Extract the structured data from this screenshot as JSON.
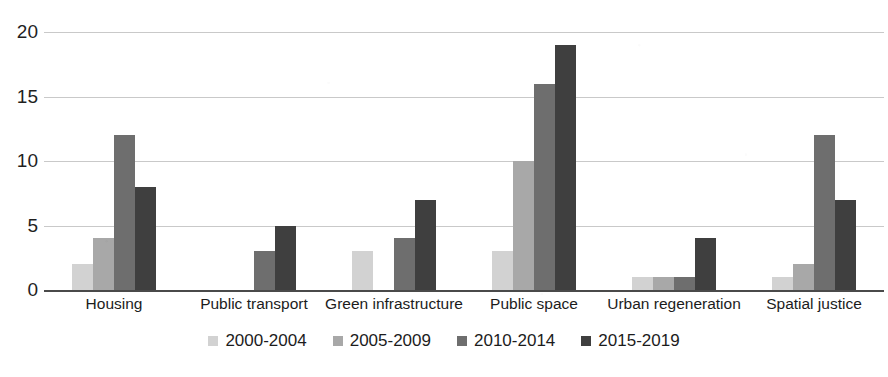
{
  "chart_data": {
    "type": "bar",
    "title": "",
    "subtitle": "",
    "xlabel": "",
    "ylabel": "",
    "ylim": [
      0,
      20
    ],
    "yticks": [
      0,
      5,
      10,
      15,
      20
    ],
    "ytick_labels": [
      "0",
      "5",
      "10",
      "15",
      "20"
    ],
    "grid": true,
    "legend_position": "bottom",
    "orientation": "vertical",
    "grouping": "grouped",
    "categories": [
      "Housing",
      "Public transport",
      "Green infrastructure",
      "Public space",
      "Urban regeneration",
      "Spatial justice"
    ],
    "series": [
      {
        "name": "2000-2004",
        "color": "#d2d2d2",
        "values": [
          2,
          0,
          3,
          3,
          1,
          1
        ]
      },
      {
        "name": "2005-2009",
        "color": "#a8a8a8",
        "values": [
          4,
          0,
          0,
          10,
          1,
          2
        ]
      },
      {
        "name": "2010-2014",
        "color": "#6e6e6e",
        "values": [
          12,
          3,
          4,
          16,
          1,
          12
        ]
      },
      {
        "name": "2015-2019",
        "color": "#3f3f3f",
        "values": [
          8,
          5,
          7,
          19,
          4,
          7
        ]
      }
    ]
  },
  "axis": {
    "zero_line_color": "#4a4a4a",
    "gridline_color": "#c9c9c9"
  }
}
